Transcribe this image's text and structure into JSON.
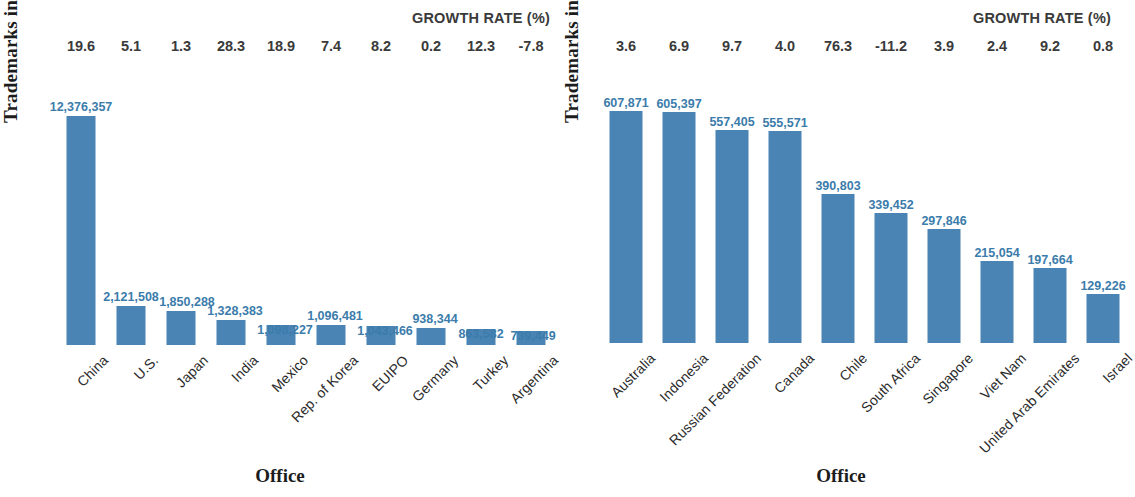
{
  "colors": {
    "bar": "#4a84b4",
    "bar_label": "#3b7cab",
    "axis_text": "#1c1c1c",
    "growth_text": "#3a3a3a"
  },
  "panels": [
    {
      "id": "top-offices",
      "growth_header": "GROWTH RATE (%)",
      "y_axis_title": "Trademarks in force",
      "x_axis_title": "Office",
      "chart_data": {
        "type": "bar",
        "title": "",
        "xlabel": "Office",
        "ylabel": "Trademarks in force",
        "categories": [
          "China",
          "U.S.",
          "Japan",
          "India",
          "Mexico",
          "Rep. of Korea",
          "EUIPO",
          "Germany",
          "Turkey",
          "Argentina"
        ],
        "values": [
          12376357,
          2121508,
          1850288,
          1328383,
          1098227,
          1096481,
          1043466,
          938344,
          863582,
          739449
        ],
        "value_labels": [
          "12,376,357",
          "2,121,508",
          "1,850,288",
          "1,328,383",
          "1,098,227",
          "1,096,481",
          "1,043,466",
          "938,344",
          "863,582",
          "739,449"
        ],
        "growth_rates": [
          "19.6",
          "5.1",
          "1.3",
          "28.3",
          "18.9",
          "7.4",
          "8.2",
          "0.2",
          "12.3",
          "-7.8"
        ],
        "ylim": [
          0,
          12376357
        ],
        "grid": false,
        "legend": "none"
      }
    },
    {
      "id": "next-offices",
      "growth_header": "GROWTH RATE (%)",
      "y_axis_title": "Trademarks in force",
      "x_axis_title": "Office",
      "chart_data": {
        "type": "bar",
        "title": "",
        "xlabel": "Office",
        "ylabel": "Trademarks in force",
        "categories": [
          "Australia",
          "Indonesia",
          "Russian Federation",
          "Canada",
          "Chile",
          "South Africa",
          "Singapore",
          "Viet Nam",
          "United Arab Emirates",
          "Israel"
        ],
        "values": [
          607871,
          605397,
          557405,
          555571,
          390803,
          339452,
          297846,
          215054,
          197664,
          129226
        ],
        "value_labels": [
          "607,871",
          "605,397",
          "557,405",
          "555,571",
          "390,803",
          "339,452",
          "297,846",
          "215,054",
          "197,664",
          "129,226"
        ],
        "growth_rates": [
          "3.6",
          "6.9",
          "9.7",
          "4.0",
          "76.3",
          "-11.2",
          "3.9",
          "2.4",
          "9.2",
          "0.8"
        ],
        "ylim": [
          0,
          607871
        ],
        "grid": false,
        "legend": "none"
      }
    }
  ]
}
